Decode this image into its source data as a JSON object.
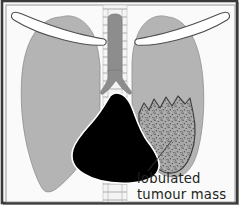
{
  "figure": {
    "type": "medical-illustration",
    "width": 242,
    "height": 208,
    "background_color": "#ffffff"
  },
  "frame": {
    "outer_border_color": "#3a3a3a",
    "inner_border_color": "#6b6b6b",
    "plate_color": "#fafafa",
    "shadow_color": "#9a9a9a"
  },
  "annotations": [
    {
      "id": "tumour-label",
      "line1": "lobulated",
      "line2": "tumour mass",
      "text_color": "#231f20",
      "leader_line": true
    }
  ],
  "anatomy": {
    "left_lung": {
      "name": "left lung field",
      "fill": "#b4b4b4",
      "stroke": "#8d8d8d"
    },
    "right_lung": {
      "name": "right lung field",
      "fill": "#b4b4b4",
      "stroke": "#8d8d8d"
    },
    "tumour_mass": {
      "name": "lobulated tumour mass",
      "fill": "#a8a8a8",
      "stroke": "#4a4a4a",
      "texture": "stippled",
      "border_shape": "lobulated"
    },
    "heart_shadow": {
      "name": "cardiac and mediastinal shadow",
      "fill": "#000000",
      "stroke": "#000000"
    },
    "trachea": {
      "name": "trachea and main bronchi",
      "fill": "#8f8f8f",
      "stroke": "#7a7a7a"
    },
    "spine": {
      "name": "thoracic vertebral column",
      "fill": "#f2f2f2",
      "stroke": "#b9b9b9",
      "vertebra_count": 14
    },
    "left_clavicle": {
      "name": "left clavicle",
      "fill": "#ffffff",
      "stroke": "#5a5a5a"
    },
    "right_clavicle": {
      "name": "right clavicle",
      "fill": "#ffffff",
      "stroke": "#5a5a5a"
    }
  }
}
